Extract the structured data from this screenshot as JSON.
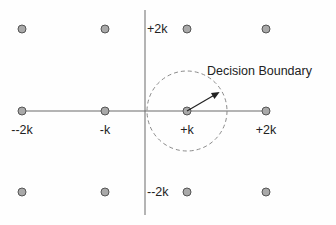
{
  "diagram": {
    "type": "constellation",
    "grid": {
      "i_levels": [
        "-2k",
        "-k",
        "+k",
        "+2k"
      ],
      "q_levels": [
        "+2k",
        "+k",
        "-k",
        "-2k"
      ]
    },
    "points": [
      {
        "i": -2,
        "q": 2
      },
      {
        "i": -1,
        "q": 2
      },
      {
        "i": 1,
        "q": 2
      },
      {
        "i": 2,
        "q": 2
      },
      {
        "i": -2,
        "q": 0
      },
      {
        "i": -1,
        "q": 0
      },
      {
        "i": 1,
        "q": 0
      },
      {
        "i": 2,
        "q": 0
      },
      {
        "i": -2,
        "q": -2
      },
      {
        "i": -1,
        "q": -2
      },
      {
        "i": 1,
        "q": -2
      },
      {
        "i": 2,
        "q": -2
      }
    ],
    "axis_labels": {
      "horizontal": [
        {
          "text": "--2k",
          "i": -2
        },
        {
          "text": "-k",
          "i": -1
        },
        {
          "text": "+k",
          "i": 1
        },
        {
          "text": "+2k",
          "i": 2
        }
      ],
      "vertical": [
        {
          "text": "+2k",
          "q": 2
        },
        {
          "text": "--2k",
          "q": -2
        }
      ]
    },
    "decision_boundary": {
      "label": "Decision Boundary",
      "center": {
        "i": 1,
        "q": 0
      },
      "style": "dashed circle"
    },
    "colors": {
      "point_fill": "#a9a9a9",
      "point_stroke": "#555555",
      "axis": "#6a6a6a",
      "text": "#222222"
    }
  }
}
